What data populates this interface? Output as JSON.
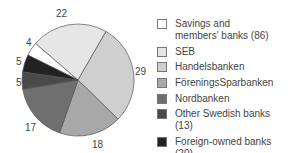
{
  "chart_data": {
    "type": "pie",
    "title": "",
    "categories": [
      "Savings and members' banks (86)",
      "SEB",
      "Handelsbanken",
      "FöreningsSparbanken",
      "Nordbanken",
      "Other Swedish banks (13)",
      "Foreign-owned banks (20)"
    ],
    "values": [
      4,
      22,
      29,
      18,
      17,
      5,
      5
    ],
    "colors": [
      "#ffffff",
      "#e6e6e6",
      "#cfcfcf",
      "#a8a8a8",
      "#6f6f6f",
      "#4a4a4a",
      "#222222"
    ],
    "legend_position": "right",
    "value_labels": [
      "4",
      "22",
      "29",
      "18",
      "17",
      "5",
      "5"
    ]
  },
  "legend": [
    {
      "label": "Savings and\nmembers' banks (86)",
      "color": "#ffffff"
    },
    {
      "label": "SEB",
      "color": "#e6e6e6"
    },
    {
      "label": "Handelsbanken",
      "color": "#cfcfcf"
    },
    {
      "label": "FöreningsSparbanken",
      "color": "#a8a8a8"
    },
    {
      "label": "Nordbanken",
      "color": "#6f6f6f"
    },
    {
      "label": "Other Swedish banks (13)",
      "color": "#4a4a4a"
    },
    {
      "label": "Foreign-owned banks (20)",
      "color": "#222222"
    }
  ],
  "slice_labels": {
    "savings": "4",
    "seb": "22",
    "handels": "29",
    "forenings": "18",
    "nord": "17",
    "other": "5",
    "foreign": "5"
  }
}
